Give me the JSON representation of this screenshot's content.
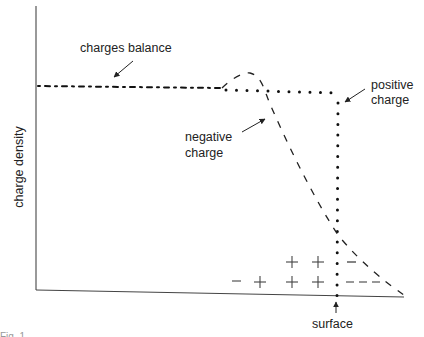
{
  "diagram": {
    "y_axis_label": "charge density",
    "labels": {
      "charges_balance": "charges balance",
      "positive_charge_line1": "positive",
      "positive_charge_line2": "charge",
      "negative_charge_line1": "negative",
      "negative_charge_line2": "charge",
      "surface": "surface"
    },
    "symbols": {
      "row_upper": [
        "+",
        "+",
        "−"
      ],
      "row_lower": [
        "−",
        "+",
        "+",
        "+",
        "− − −"
      ]
    },
    "caption": "Fig. 1"
  }
}
